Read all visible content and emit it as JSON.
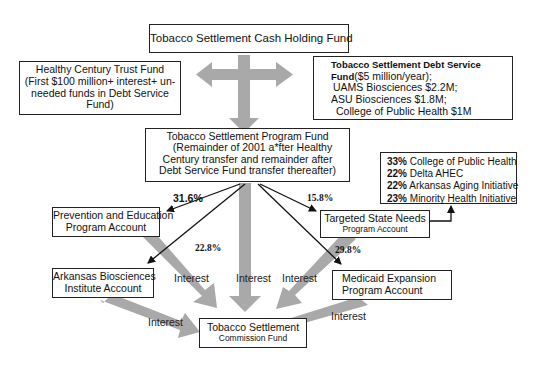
{
  "colors": {
    "gray_arrow": "#a9a9a9",
    "box_border": "#222222",
    "text": "#111111",
    "background": "#ffffff"
  },
  "nodes": {
    "cash_holding": {
      "title": "Tobacco Settlement Cash Holding Fund"
    },
    "healthy_century": {
      "title": "Healthy Century Trust Fund",
      "lines": [
        "(First $100 million+ interest+ un-",
        "needed funds in Debt Service",
        "Fund)"
      ]
    },
    "debt_service": {
      "title_bold_1": "Tobacco Settlement Debt Service",
      "title_bold_2": "Fund",
      "title_suffix": "($5 million/year);",
      "lines": [
        "UAMS Biosciences $2.2M;",
        "ASU Biosciences $1.8M;",
        "College of Public Health $1M"
      ]
    },
    "program_fund": {
      "title": "Tobacco Settlement Program Fund",
      "lines": [
        "(Remainder of 2001 a*fter Healthy",
        "Century transfer and remainder after",
        "Debt Service Fund transfer thereafter)"
      ]
    },
    "allocations": {
      "items": [
        {
          "pct": "33%",
          "label": "College of Public Health"
        },
        {
          "pct": "22%",
          "label": "Delta AHEC"
        },
        {
          "pct": "22%",
          "label": "Arkansas Aging Initiative"
        },
        {
          "pct": "23%",
          "label": "Minority Health Initiative"
        }
      ]
    },
    "prevention": {
      "line1": "Prevention and Education",
      "line2": "Program Account"
    },
    "targeted": {
      "line1": "Targeted State Needs",
      "line2": "Program Account"
    },
    "biosciences": {
      "line1": "Arkansas Biosciences",
      "line2": "Institute Account"
    },
    "medicaid": {
      "line1": "Medicaid Expansion",
      "line2": "Program Account"
    },
    "commission": {
      "line1": "Tobacco Settlement",
      "line2": "Commission Fund"
    }
  },
  "edges": {
    "prevention_pct": "31.6%",
    "biosciences_pct": "22.8%",
    "targeted_pct": "15.8%",
    "medicaid_pct": "29.8%",
    "interest_label": "Interest"
  }
}
